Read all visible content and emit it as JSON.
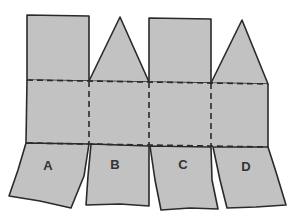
{
  "diagram": {
    "colors": {
      "fill": "#c2c2c2",
      "stroke": "#2a2a2a",
      "label": "#333333",
      "background": "#ffffff"
    },
    "panels": [
      {
        "id": "A",
        "label": "A",
        "top_flap": "rectangle"
      },
      {
        "id": "B",
        "label": "B",
        "top_flap": "triangle"
      },
      {
        "id": "C",
        "label": "C",
        "top_flap": "rectangle"
      },
      {
        "id": "D",
        "label": "D",
        "top_flap": "triangle"
      }
    ],
    "fold_lines": [
      "upper-horizontal",
      "lower-horizontal",
      "vertical-AB",
      "vertical-BC",
      "vertical-CD"
    ]
  }
}
